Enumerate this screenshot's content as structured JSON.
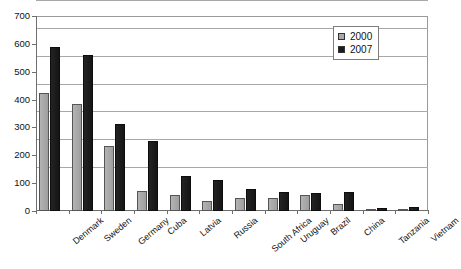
{
  "chart_data": {
    "type": "bar",
    "title": "",
    "subtitle": "",
    "xlabel": "",
    "ylabel": "",
    "ylim": [
      0,
      700
    ],
    "yticks": [
      0,
      100,
      200,
      300,
      400,
      500,
      600,
      700
    ],
    "ytick_labels": [
      "0",
      "100",
      "200",
      "300",
      "400",
      "500",
      "600",
      "700"
    ],
    "grid": true,
    "legend_position": "top-right",
    "categories": [
      "Denmark",
      "Sweden",
      "Germany",
      "Cuba",
      "Latvia",
      "Russia",
      "South Africa",
      "Uruguay",
      "Brazil",
      "China",
      "Tanzania",
      "Vietnam"
    ],
    "series": [
      {
        "name": "2000",
        "color": "#a8a8a8",
        "values": [
          422,
          385,
          232,
          73,
          57,
          37,
          45,
          48,
          57,
          25,
          5,
          4
        ]
      },
      {
        "name": "2007",
        "color": "#1b1b1b",
        "values": [
          588,
          560,
          312,
          250,
          127,
          113,
          78,
          70,
          65,
          67,
          12,
          14
        ]
      }
    ]
  },
  "legend": {
    "entries": [
      {
        "label": "2000",
        "swatch": "gray-square-icon"
      },
      {
        "label": "2007",
        "swatch": "black-square-icon"
      }
    ]
  }
}
